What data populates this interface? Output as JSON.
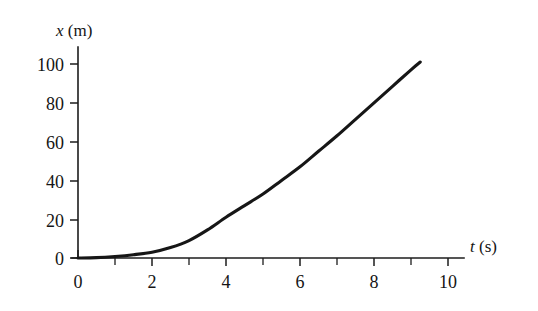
{
  "figure": {
    "name": "position-time-graph",
    "background_color": "#ffffff",
    "ink_color": "#161616"
  },
  "chart_data": {
    "type": "line",
    "title": "",
    "subtitle": "",
    "xlabel": "t (s)",
    "xlabel_variable": "t",
    "xlabel_unit": "(s)",
    "ylabel": "x (m)",
    "ylabel_variable": "x",
    "ylabel_unit": "(m)",
    "xlim": [
      0,
      11
    ],
    "ylim": [
      0,
      108
    ],
    "grid": false,
    "legend": null,
    "x_tick_labels": [
      "0",
      "2",
      "4",
      "6",
      "8",
      "10"
    ],
    "x_tick_values": [
      0,
      2,
      4,
      6,
      8,
      10
    ],
    "x_minor_tick_values": [
      1,
      3,
      5,
      7,
      9
    ],
    "y_tick_labels": [
      "0",
      "20",
      "40",
      "60",
      "80",
      "100"
    ],
    "y_tick_values": [
      0,
      20,
      40,
      60,
      80,
      100
    ],
    "series": [
      {
        "name": "position",
        "x": [
          0,
          0.5,
          1,
          1.5,
          2,
          2.5,
          3,
          3.5,
          4,
          4.5,
          5,
          5.5,
          6,
          6.5,
          7,
          7.5,
          8,
          8.5,
          9,
          9.25
        ],
        "values": [
          0,
          0.2,
          0.8,
          1.7,
          3.0,
          5.4,
          9.0,
          14.5,
          21.0,
          27.0,
          33.0,
          40.0,
          47.0,
          55.0,
          63.0,
          71.5,
          80.0,
          88.5,
          97.0,
          101.0
        ]
      }
    ],
    "annotations": []
  }
}
